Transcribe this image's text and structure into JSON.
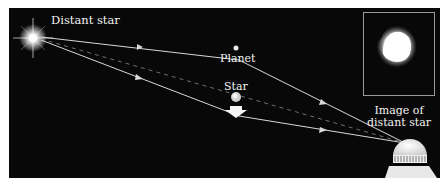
{
  "labels": {
    "distant_star": "Distant star",
    "planet": "Planet",
    "star": "Star",
    "image_line1": "Image of",
    "image_line2": "distant star"
  },
  "colors": {
    "background": "#080808",
    "ray": "#d8d8d8",
    "text": "#f2f2f2",
    "frame": "#9a9a9a"
  },
  "icons": {
    "distant_star": "glowing-star",
    "planet": "small-dot",
    "lens_star": "small-sphere",
    "arrow": "down-arrow",
    "telescope": "observatory-dome"
  }
}
